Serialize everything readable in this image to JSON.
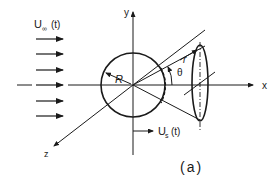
{
  "figure": {
    "caption": "(a)",
    "labels": {
      "freestream_velocity": "U∞(t)",
      "freestream_main": "U",
      "freestream_sub": "∞",
      "freestream_arg": "(t)",
      "sphere_velocity_main": "U",
      "sphere_velocity_sub": "s",
      "sphere_velocity_arg": "(t)",
      "radius": "R",
      "distance": "r",
      "angle": "θ",
      "axis_x": "x",
      "axis_y": "y",
      "axis_z": "z"
    },
    "flow_arrow_count": 6,
    "stroke_color": "#1a1a1a",
    "background_color": "#ffffff"
  }
}
